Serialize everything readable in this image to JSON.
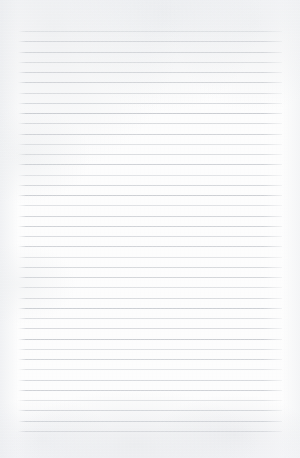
{
  "document": {
    "kind": "scanned-lined-paper",
    "title": "Blank ruled notebook page",
    "page_text": "",
    "visible_text": "",
    "handwriting": "",
    "paper_color": "#fdfdfd",
    "rule_color": "#c9ccd1",
    "edge_shadow_color": "#e9ebee"
  },
  "ruling": {
    "line_count": 40,
    "first_line_y": 31,
    "line_spacing": 10.25,
    "line_left_x": 18,
    "line_right_x": 282,
    "line_thickness": 1,
    "margin_top": 31,
    "margin_bottom": 28,
    "margin_left": 18,
    "margin_right": 18,
    "has_vertical_margin_rule": false
  },
  "canvas": {
    "width": 300,
    "height": 458
  }
}
